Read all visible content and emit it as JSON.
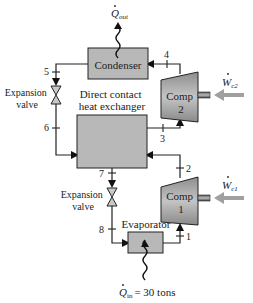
{
  "diagram": {
    "type": "two-stage vapor-compression refrigeration cycle with direct contact heat exchanger",
    "components": {
      "condenser": {
        "label": "Condenser"
      },
      "heat_exchanger": {
        "label_line1": "Direct contact",
        "label_line2": "heat exchanger"
      },
      "compressor_2": {
        "label_line1": "Comp",
        "label_line2": "2"
      },
      "compressor_1": {
        "label_line1": "Comp",
        "label_line2": "1"
      },
      "evaporator": {
        "label": "Evaporator"
      },
      "expansion_valve_upper": {
        "label_line1": "Expansion",
        "label_line2": "valve"
      },
      "expansion_valve_lower": {
        "label_line1": "Expansion",
        "label_line2": "valve"
      }
    },
    "heat": {
      "q_out": {
        "symbol": "Q",
        "subscript": "out"
      },
      "q_in": {
        "symbol": "Q",
        "subscript": "in",
        "value": "= 30 tons"
      }
    },
    "work": {
      "w_c2": {
        "symbol": "W",
        "subscript": "c2"
      },
      "w_c1": {
        "symbol": "W",
        "subscript": "c1"
      }
    },
    "states": [
      "1",
      "2",
      "3",
      "4",
      "5",
      "6",
      "7",
      "8"
    ],
    "colors": {
      "box_fill": "#b8b8b8",
      "compressor_fill": "#a9a9a9",
      "work_arrow": "#a0a0a0",
      "line": "#222222"
    }
  }
}
